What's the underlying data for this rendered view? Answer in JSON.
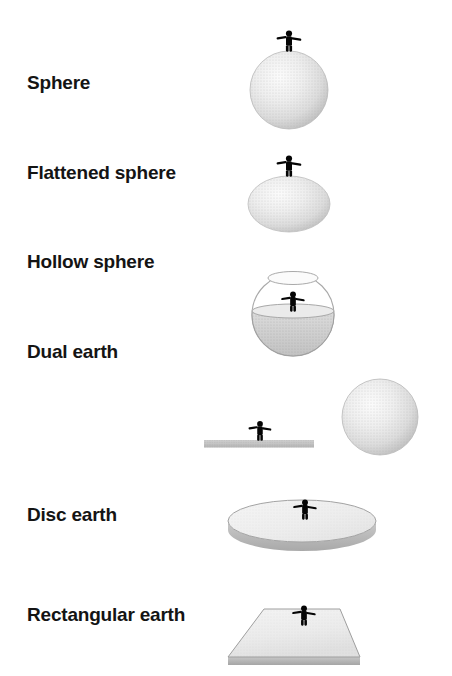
{
  "figure": {
    "background_color": "#ffffff",
    "label_color": "#141414",
    "shape_fill_light": "#f2f2f2",
    "shape_fill_mid": "#d9d9d9",
    "shape_fill_dark": "#b3b3b3",
    "shape_outline": "#8c8c8c",
    "person_color": "#000000",
    "person_icon": "standing-person-arms-out-icon",
    "width": 452,
    "height": 676
  },
  "rows": [
    {
      "id": "sphere",
      "label": "Sphere",
      "label_y": 73,
      "shape": "sphere",
      "person_count": 1
    },
    {
      "id": "flattened-sphere",
      "label": "Flattened sphere",
      "label_y": 163,
      "shape": "oblate-spheroid",
      "person_count": 1
    },
    {
      "id": "hollow-sphere",
      "label": "Hollow sphere",
      "label_y": 252,
      "shape": "hollow-sphere-bowl",
      "person_count": 1
    },
    {
      "id": "dual-earth",
      "label": "Dual earth",
      "label_y": 342,
      "shape": "flat-bar-plus-separate-sphere",
      "person_count": 1
    },
    {
      "id": "disc-earth",
      "label": "Disc earth",
      "label_y": 415,
      "shape": "disc",
      "person_count": 1
    },
    {
      "id": "rectangular-earth",
      "label": "Rectangular earth",
      "label_y": 502,
      "shape": "rectangular-plate",
      "person_count": 1
    }
  ]
}
